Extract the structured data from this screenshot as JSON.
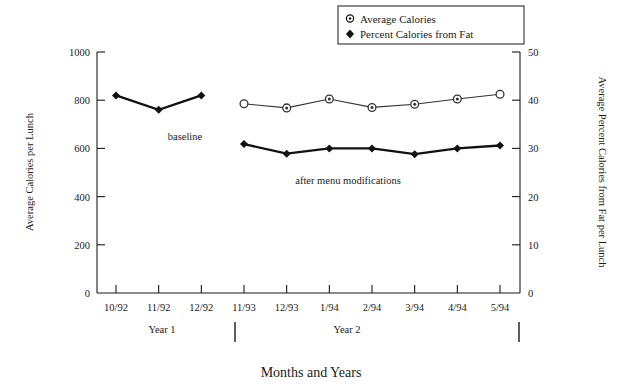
{
  "chart_data": {
    "type": "line",
    "title": "",
    "xlabel": "Months and Years",
    "categories": [
      "10/92",
      "11/92",
      "12/92",
      "11/93",
      "12/93",
      "1/94",
      "2/94",
      "3/94",
      "4/94",
      "5/94"
    ],
    "grid": false,
    "legend_position": "top-right",
    "axes": {
      "left": {
        "label": "Average Calories per Lunch",
        "ticks": [
          "0",
          "200",
          "400",
          "600",
          "800",
          "1000"
        ],
        "tick_values": [
          0,
          200,
          400,
          600,
          800,
          1000
        ],
        "lim": [
          0,
          1000
        ]
      },
      "right": {
        "label": "Average Percent Calories from Fat per Lunch",
        "ticks": [
          "0",
          "10",
          "20",
          "30",
          "40",
          "50"
        ],
        "tick_values": [
          0,
          10,
          20,
          30,
          40,
          50
        ],
        "lim": [
          0,
          50
        ]
      }
    },
    "series": [
      {
        "name": "Average Calories",
        "axis": "left",
        "marker": "open-circle",
        "x": [
          "11/93",
          "12/93",
          "1/94",
          "2/94",
          "3/94",
          "4/94",
          "5/94"
        ],
        "values": [
          785,
          768,
          805,
          770,
          783,
          805,
          825
        ]
      },
      {
        "name": "Percent Calories from Fat",
        "axis": "right",
        "marker": "filled-diamond",
        "x": [
          "10/92",
          "11/92",
          "12/92",
          "11/93",
          "12/93",
          "1/94",
          "2/94",
          "3/94",
          "4/94",
          "5/94"
        ],
        "values": [
          41.0,
          38.0,
          41.0,
          30.9,
          28.9,
          30.0,
          30.0,
          28.8,
          30.0,
          30.6
        ]
      }
    ],
    "annotations": [
      {
        "text": "baseline",
        "near_x": "11/92"
      },
      {
        "text": "after menu modifications",
        "near_x": "2/94"
      }
    ],
    "group_labels": [
      {
        "text": "Year 1"
      },
      {
        "text": "Year 2"
      }
    ]
  },
  "legend": {
    "items": [
      {
        "label": "Average Calories",
        "marker": "open-circle"
      },
      {
        "label": "Percent Calories from Fat",
        "marker": "filled-diamond"
      }
    ]
  },
  "colors": {
    "ink": "#1a1a1a",
    "background": "#ffffff",
    "series_fat": "#111111",
    "series_calories": "#333333"
  }
}
